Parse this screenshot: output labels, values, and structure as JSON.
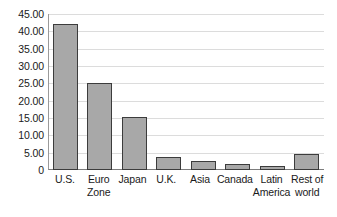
{
  "chart_data": {
    "type": "bar",
    "title": "",
    "subtitle": "",
    "xlabel": "",
    "ylabel": "",
    "categories": [
      "U.S.",
      "Euro Zone",
      "Japan",
      "U.K.",
      "Asia",
      "Canada",
      "Latin America",
      "Rest of world"
    ],
    "category_lines": [
      [
        "U.S.",
        ""
      ],
      [
        "Euro",
        "Zone"
      ],
      [
        "Japan",
        ""
      ],
      [
        "U.K.",
        ""
      ],
      [
        "Asia",
        ""
      ],
      [
        "Canada",
        ""
      ],
      [
        "Latin",
        "America"
      ],
      [
        "Rest of",
        "world"
      ]
    ],
    "values": [
      42.2,
      25.0,
      15.3,
      3.8,
      2.6,
      1.7,
      1.2,
      4.7
    ],
    "ylim": [
      0,
      45
    ],
    "ytick_values": [
      45,
      40,
      35,
      30,
      25,
      20,
      15,
      10,
      5,
      0
    ],
    "ytick_labels": [
      "45.00",
      "40.00",
      "35.00",
      "30.00",
      "25.00",
      "20.00",
      "15.00",
      "10.00",
      "5.00",
      "0"
    ],
    "grid": true,
    "legend": "none",
    "colors": {
      "bar_fill": "#a8a8a8",
      "bar_border": "#3c3c3c",
      "gridline": "#dcdcdc",
      "axis": "#7d7d7d",
      "text": "#1a1a1a",
      "background": "#ffffff"
    }
  }
}
